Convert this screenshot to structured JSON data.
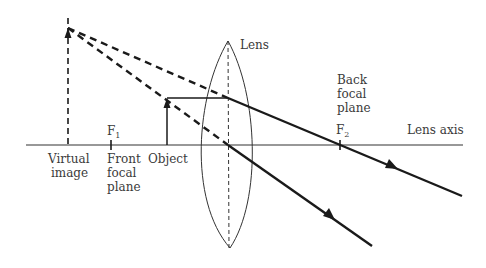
{
  "diagram": {
    "labels": {
      "lens": "Lens",
      "back_focal_plane": [
        "Back",
        "focal",
        "plane"
      ],
      "f2": "F",
      "f2_sub": "2",
      "lens_axis": "Lens axis",
      "f1": "F",
      "f1_sub": "1",
      "virtual_image": [
        "Virtual",
        "image"
      ],
      "front_focal_plane": [
        "Front",
        "focal",
        "plane"
      ],
      "object": "Object"
    },
    "colors": {
      "line": "#1a1a1a",
      "thin": "#333333",
      "text": "#3a3a3a",
      "background": "#ffffff"
    }
  }
}
